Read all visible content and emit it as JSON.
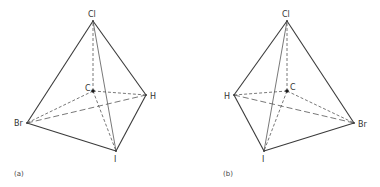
{
  "figure": {
    "panels": [
      {
        "id": "a",
        "label": "(a)",
        "center_atom": "C",
        "vertices": {
          "top": "Cl",
          "right": "H",
          "left": "Br",
          "bottom": "I"
        }
      },
      {
        "id": "b",
        "label": "(b)",
        "center_atom": "C",
        "vertices": {
          "top": "Cl",
          "left": "H",
          "right": "Br",
          "bottom": "I"
        }
      }
    ]
  },
  "labels": {
    "a": {
      "cl": "Cl",
      "c": "C",
      "h": "H",
      "br": "Br",
      "i": "I",
      "panel": "(a)"
    },
    "b": {
      "cl": "Cl",
      "c": "C",
      "h": "H",
      "br": "Br",
      "i": "I",
      "panel": "(b)"
    }
  }
}
